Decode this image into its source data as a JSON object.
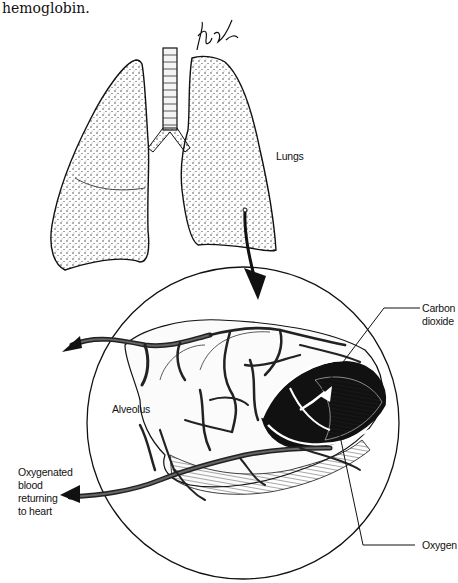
{
  "caption": {
    "text_fragment": "hemoglobin."
  },
  "diagram": {
    "title": "",
    "signature": "artist signature",
    "labels": {
      "lungs": "Lungs",
      "alveolus": "Alveolus",
      "carbon_dioxide": "Carbon\ndioxide",
      "oxygen": "Oxygen",
      "oxygenated_blood": "Oxygenated\nblood\nreturning\nto heart"
    },
    "nodes": [
      {
        "id": "lungs",
        "label": "Lungs",
        "shape": "illustration"
      },
      {
        "id": "trachea",
        "label": "",
        "shape": "illustration"
      },
      {
        "id": "alveolus-magnified",
        "label": "Alveolus",
        "shape": "circle-inset"
      },
      {
        "id": "capillaries",
        "label": "",
        "shape": "illustration"
      },
      {
        "id": "co2",
        "label": "Carbon dioxide",
        "shape": "arrow-annotation"
      },
      {
        "id": "o2",
        "label": "Oxygen",
        "shape": "arrow-annotation"
      }
    ],
    "edges": [
      {
        "from": "lungs",
        "to": "alveolus-magnified",
        "label": "magnify"
      },
      {
        "from": "capillaries",
        "to": "co2",
        "label": "CO2 exits blood into alveolus"
      },
      {
        "from": "alveolus-magnified",
        "to": "o2",
        "label": "O2 enters blood"
      },
      {
        "from": "capillaries",
        "to": "heart",
        "label": "Oxygenated blood returning to heart"
      }
    ]
  },
  "colors": {
    "ink": "#111111",
    "background": "#ffffff"
  }
}
